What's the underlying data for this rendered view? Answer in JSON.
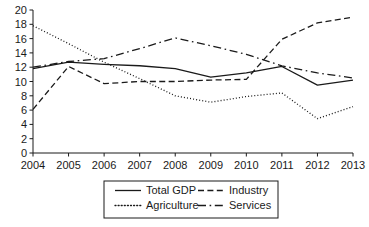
{
  "chart_data": {
    "type": "line",
    "title": "",
    "xlabel": "",
    "ylabel": "",
    "x": [
      2004,
      2005,
      2006,
      2007,
      2008,
      2009,
      2010,
      2011,
      2012,
      2013
    ],
    "categories": [
      "2004",
      "2005",
      "2006",
      "2007",
      "2008",
      "2009",
      "2010",
      "2011",
      "2012",
      "2013"
    ],
    "xlim": [
      2004,
      2013
    ],
    "ylim": [
      0,
      20
    ],
    "ytick_values": [
      0,
      2,
      4,
      6,
      8,
      10,
      12,
      14,
      16,
      18,
      20
    ],
    "ytick_labels": [
      "0",
      "2",
      "4",
      "6",
      "8",
      "10",
      "12",
      "14",
      "16",
      "18",
      "20"
    ],
    "grid": false,
    "legend_position": "bottom-center",
    "series": [
      {
        "name": "Total GDP",
        "style": "solid",
        "values": [
          11.8,
          12.7,
          12.4,
          12.2,
          11.8,
          10.6,
          11.2,
          12.1,
          9.5,
          10.2
        ]
      },
      {
        "name": "Industry",
        "style": "dashed",
        "values": [
          6.1,
          12.1,
          9.7,
          10.0,
          10.0,
          10.2,
          10.3,
          15.9,
          18.2,
          19.0
        ]
      },
      {
        "name": "Agriculture",
        "style": "dotted",
        "values": [
          17.8,
          15.3,
          12.7,
          10.4,
          8.0,
          7.1,
          7.9,
          8.4,
          4.8,
          6.5
        ]
      },
      {
        "name": "Services",
        "style": "dashdot",
        "values": [
          12.0,
          12.8,
          13.2,
          14.6,
          16.1,
          15.0,
          13.8,
          12.2,
          11.2,
          10.5
        ]
      }
    ]
  },
  "legend": {
    "entries": [
      {
        "label": "Total GDP",
        "style": "solid"
      },
      {
        "label": "Industry",
        "style": "dashed"
      },
      {
        "label": "Agriculture",
        "style": "dotted"
      },
      {
        "label": "Services",
        "style": "dashdot"
      }
    ]
  },
  "colors": {
    "ink": "#1a1a1a",
    "background": "#ffffff"
  }
}
